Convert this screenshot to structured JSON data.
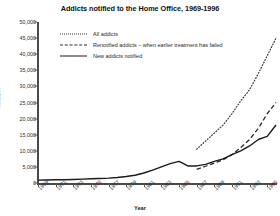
{
  "chart_data": {
    "type": "line",
    "title": "Addicts notified to the Home Office, 1969-1996",
    "xlabel": "Year",
    "ylabel": "Number",
    "xlim": [
      1969,
      1996
    ],
    "ylim": [
      0,
      50000
    ],
    "grid": false,
    "legend_position": "top-left-inside",
    "y_ticks": [
      "0",
      "5,000",
      "10,000",
      "15,000",
      "20,000",
      "25,000",
      "30,000",
      "35,000",
      "40,000",
      "45,000",
      "50,000"
    ],
    "y_tick_values": [
      0,
      5000,
      10000,
      15000,
      20000,
      25000,
      30000,
      35000,
      40000,
      45000,
      50000
    ],
    "x_ticks": [
      "1969",
      "1971",
      "1973",
      "1975",
      "1977",
      "1979",
      "1981",
      "1983",
      "1985",
      "1987",
      "1989",
      "1991",
      "1993",
      "1995"
    ],
    "x_tick_values": [
      1969,
      1971,
      1973,
      1975,
      1977,
      1979,
      1981,
      1983,
      1985,
      1987,
      1989,
      1991,
      1993,
      1995
    ],
    "series": [
      {
        "name": "All addicts",
        "style": "dotted",
        "color": "#3a3a3a",
        "x": [
          1987,
          1988,
          1989,
          1990,
          1991,
          1992,
          1993,
          1994,
          1995,
          1996
        ],
        "values": [
          10500,
          13000,
          15500,
          18000,
          21500,
          25500,
          29000,
          34000,
          39500,
          45000
        ]
      },
      {
        "name": "Renotified addicts – when earlier treatment has failed",
        "style": "dashed",
        "color": "#2a2a2a",
        "x": [
          1987,
          1988,
          1989,
          1990,
          1991,
          1992,
          1993,
          1994,
          1995,
          1996
        ],
        "values": [
          4200,
          5200,
          6200,
          7200,
          8800,
          11000,
          13500,
          17000,
          21500,
          25000
        ]
      },
      {
        "name": "New addicts notified",
        "style": "solid",
        "color": "#1a1a1a",
        "x": [
          1969,
          1970,
          1971,
          1972,
          1973,
          1974,
          1975,
          1976,
          1977,
          1978,
          1979,
          1980,
          1981,
          1982,
          1983,
          1984,
          1985,
          1986,
          1987,
          1988,
          1989,
          1990,
          1991,
          1992,
          1993,
          1994,
          1995,
          1996
        ],
        "values": [
          900,
          950,
          1000,
          1000,
          1100,
          1200,
          1300,
          1400,
          1500,
          1700,
          2000,
          2400,
          3100,
          4000,
          5000,
          6000,
          6700,
          5300,
          5300,
          5800,
          6700,
          7500,
          8800,
          10000,
          11500,
          13500,
          14500,
          18000
        ]
      }
    ]
  },
  "legend": {
    "items": [
      {
        "label": "All addicts"
      },
      {
        "label": "Renotified addicts – when earlier treatment has failed"
      },
      {
        "label": "New addicts notified"
      }
    ]
  }
}
